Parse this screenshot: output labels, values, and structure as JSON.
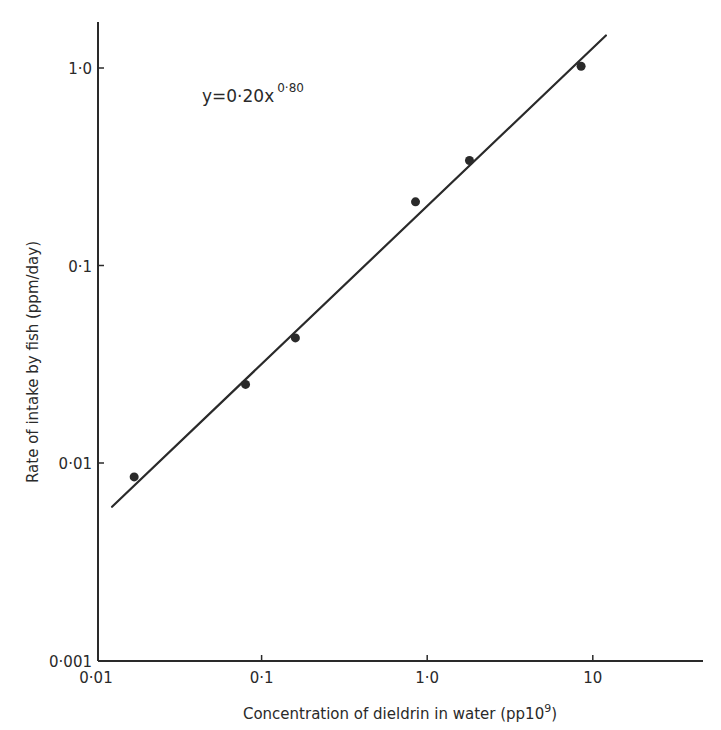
{
  "chart_data": {
    "type": "scatter",
    "title": "",
    "xlabel": "Concentration of dieldrin in water (pp10⁹)",
    "xlabel_main": "Concentration of dieldrin in water (pp10",
    "xlabel_sup": "9",
    "xlabel_end": ")",
    "ylabel": "Rate of intake by fish (ppm/day)",
    "xscale": "log",
    "yscale": "log",
    "xlim": [
      0.01,
      12
    ],
    "ylim": [
      0.001,
      1.6
    ],
    "grid": false,
    "x_ticks": [
      {
        "value": 0.01,
        "label": "0·01"
      },
      {
        "value": 0.1,
        "label": "0·1"
      },
      {
        "value": 1.0,
        "label": "1·0"
      },
      {
        "value": 10,
        "label": "10"
      }
    ],
    "y_ticks": [
      {
        "value": 0.001,
        "label": "0·001"
      },
      {
        "value": 0.01,
        "label": "0·01"
      },
      {
        "value": 0.1,
        "label": "0·1"
      },
      {
        "value": 1.0,
        "label": "1·0"
      }
    ],
    "series": [
      {
        "name": "Observed intake",
        "marker": "filled-circle",
        "x": [
          0.017,
          0.08,
          0.16,
          0.85,
          1.8,
          8.5
        ],
        "y": [
          0.0085,
          0.025,
          0.043,
          0.21,
          0.34,
          1.02
        ]
      }
    ],
    "fit_line": {
      "equation": "y = 0.20x^0.80",
      "coefficient": 0.2,
      "exponent": 0.8,
      "x_range": [
        0.0125,
        12
      ]
    },
    "annotations": [
      {
        "text": "y=0·20x",
        "superscript": "0·80",
        "position": "upper-left"
      }
    ],
    "legend": "none"
  },
  "colors": {
    "ink": "#2a2a2a",
    "background": "#ffffff"
  }
}
